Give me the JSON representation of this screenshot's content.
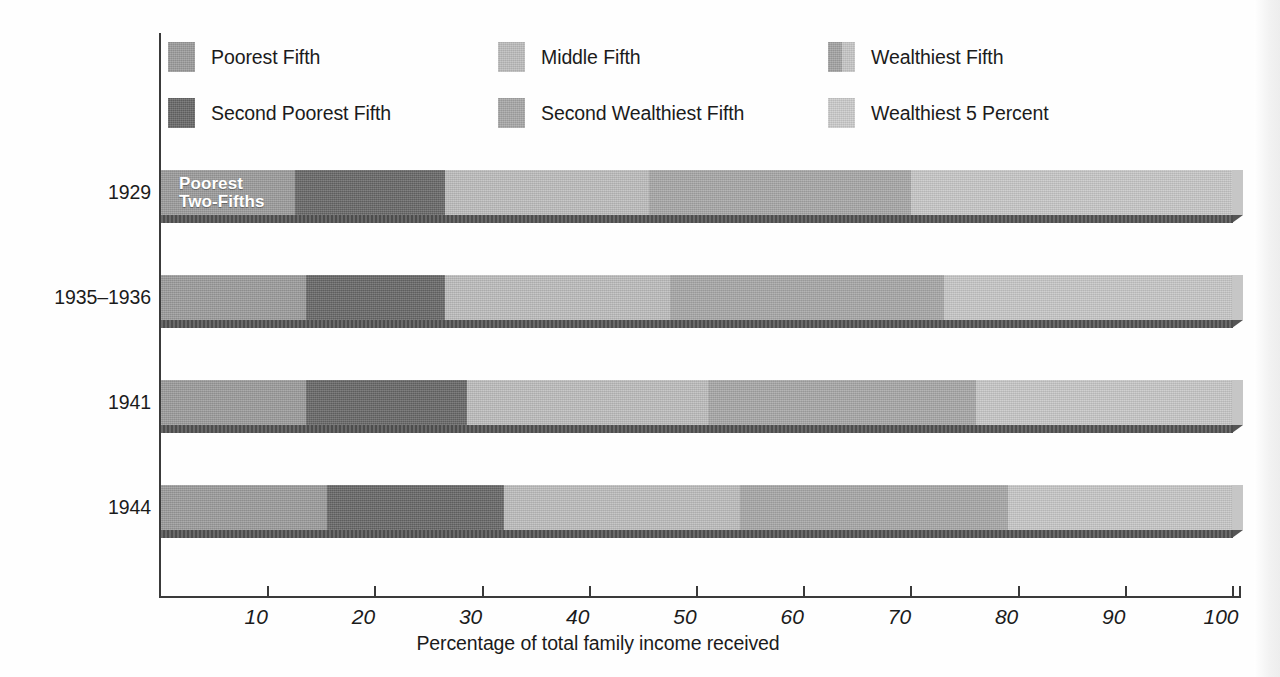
{
  "chart_data": {
    "type": "bar",
    "orientation": "horizontal",
    "stacked": true,
    "title": "",
    "xlabel": "Percentage of total family income received",
    "ylabel": "",
    "xlim": [
      0,
      100
    ],
    "xticks": [
      10,
      20,
      30,
      40,
      50,
      60,
      70,
      80,
      90,
      100
    ],
    "xtick_labels": [
      "10",
      "20",
      "30",
      "40",
      "50",
      "60",
      "70",
      "80",
      "90",
      "100"
    ],
    "grid": false,
    "legend_position": "top",
    "categories": [
      "1929",
      "1935–1936",
      "1941",
      "1944"
    ],
    "series": [
      {
        "name": "Poorest Fifth",
        "color": "#9a9a9a",
        "values": [
          12.5,
          13.5,
          13.5,
          15.5
        ]
      },
      {
        "name": "Second Poorest Fifth",
        "color": "#666666",
        "values": [
          14.0,
          13.0,
          15.0,
          16.5
        ]
      },
      {
        "name": "Middle Fifth",
        "color": "#bcbcbc",
        "values": [
          19.0,
          21.0,
          22.5,
          22.0
        ]
      },
      {
        "name": "Second Wealthiest Fifth",
        "color": "#a6a6a6",
        "values": [
          24.5,
          25.5,
          25.0,
          25.0
        ]
      },
      {
        "name": "Wealthiest Fifth",
        "color": "#c6c6c6",
        "values": [
          30.0,
          27.0,
          24.0,
          21.0
        ]
      }
    ],
    "cumulative_boundaries": [
      [
        12.5,
        26.5,
        45.5,
        70.0,
        100.0
      ],
      [
        13.5,
        26.5,
        47.5,
        73.0,
        100.0
      ],
      [
        13.5,
        28.5,
        51.0,
        76.0,
        100.0
      ],
      [
        15.5,
        32.0,
        54.0,
        79.0,
        100.0
      ]
    ],
    "annotations": [
      {
        "text": "Poorest\nTwo-Fifths",
        "category": "1929",
        "position": "inside-left",
        "color": "#ffffff"
      }
    ]
  },
  "legend": {
    "items": [
      {
        "label": "Poorest Fifth",
        "color": "#9a9a9a",
        "two_tone": false
      },
      {
        "label": "Middle Fifth",
        "color": "#bcbcbc",
        "two_tone": false
      },
      {
        "label": "Wealthiest Fifth",
        "color": "#a2a2a2",
        "color_right": "#c6c6c6",
        "two_tone": true
      },
      {
        "label": "Second Poorest Fifth",
        "color": "#666666",
        "two_tone": false
      },
      {
        "label": "Second Wealthiest Fifth",
        "color": "#a6a6a6",
        "two_tone": false
      },
      {
        "label": "Wealthiest 5 Percent",
        "color": "#cbcbcb",
        "two_tone": false
      }
    ]
  },
  "axis": {
    "x_title": "Percentage of total family income received",
    "tick_labels": [
      "10",
      "20",
      "30",
      "40",
      "50",
      "60",
      "70",
      "80",
      "90",
      "100"
    ],
    "category_labels": [
      "1929",
      "1935–1936",
      "1941",
      "1944"
    ]
  },
  "inbar": {
    "line1": "Poorest",
    "line2": "Two-Fifths"
  },
  "colors": {
    "poorest_fifth": "#9a9a9a",
    "second_poorest_fifth": "#666666",
    "middle_fifth": "#bcbcbc",
    "second_wealthiest_fifth": "#a6a6a6",
    "wealthiest_fifth": "#c6c6c6",
    "wealthiest_5_percent": "#cbcbcb",
    "bar_shadow": "#555555",
    "axis": "#3a3a3a",
    "text": "#1b1b1b",
    "background": "#ffffff"
  }
}
